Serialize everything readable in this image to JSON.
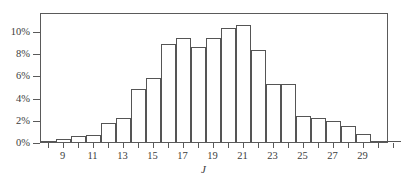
{
  "chart_data": {
    "type": "bar",
    "title": "",
    "subtitle": "",
    "xlabel": "J",
    "ylabel": "",
    "grid": false,
    "legend": null,
    "xlim": [
      7.5,
      31.5
    ],
    "ylim": [
      0,
      11.5
    ],
    "x_tick_labels": [
      "9",
      "11",
      "13",
      "15",
      "17",
      "19",
      "21",
      "23",
      "25",
      "27",
      "29"
    ],
    "x_tick_values": [
      9,
      11,
      13,
      15,
      17,
      19,
      21,
      23,
      25,
      27,
      29
    ],
    "y_tick_labels": [
      "0%",
      "2%",
      "4%",
      "6%",
      "8%",
      "10%"
    ],
    "y_tick_values": [
      0,
      2,
      4,
      6,
      8,
      10
    ],
    "y_unit": "%",
    "categories": [
      8,
      9,
      10,
      11,
      12,
      13,
      14,
      15,
      16,
      17,
      18,
      19,
      20,
      21,
      22,
      23,
      24,
      25,
      26,
      27,
      28,
      29,
      30,
      31
    ],
    "values": [
      0.1,
      0.3,
      0.5,
      0.6,
      1.75,
      2.2,
      4.8,
      5.75,
      8.8,
      9.35,
      8.6,
      9.35,
      10.25,
      10.55,
      8.3,
      5.25,
      5.2,
      2.35,
      2.15,
      1.9,
      1.4,
      0.7,
      0.1,
      0.05
    ],
    "bar_edge_color": "#555555",
    "bar_fill_color": "#ffffff",
    "axis_color": "#5a5a5a"
  }
}
